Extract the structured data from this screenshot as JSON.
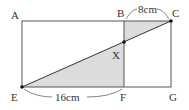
{
  "diagram": {
    "type": "geometry",
    "colors": {
      "line": "#555555",
      "shade": "#dcdcdc",
      "point": "#111111",
      "text": "#333333"
    },
    "points": {
      "A": {
        "label": "A",
        "x": 22,
        "y": 21
      },
      "B": {
        "label": "B",
        "x": 124,
        "y": 21
      },
      "C": {
        "label": "C",
        "x": 171,
        "y": 21
      },
      "E": {
        "label": "E",
        "x": 22,
        "y": 87
      },
      "F": {
        "label": "F",
        "x": 124,
        "y": 87
      },
      "G": {
        "label": "G",
        "x": 171,
        "y": 87
      },
      "X": {
        "label": "X",
        "x": 124,
        "y": 42
      }
    },
    "measurements": {
      "BC": "8cm",
      "EF": "16cm"
    },
    "shaded_regions": [
      "triangle BXC",
      "triangle EFX"
    ]
  }
}
